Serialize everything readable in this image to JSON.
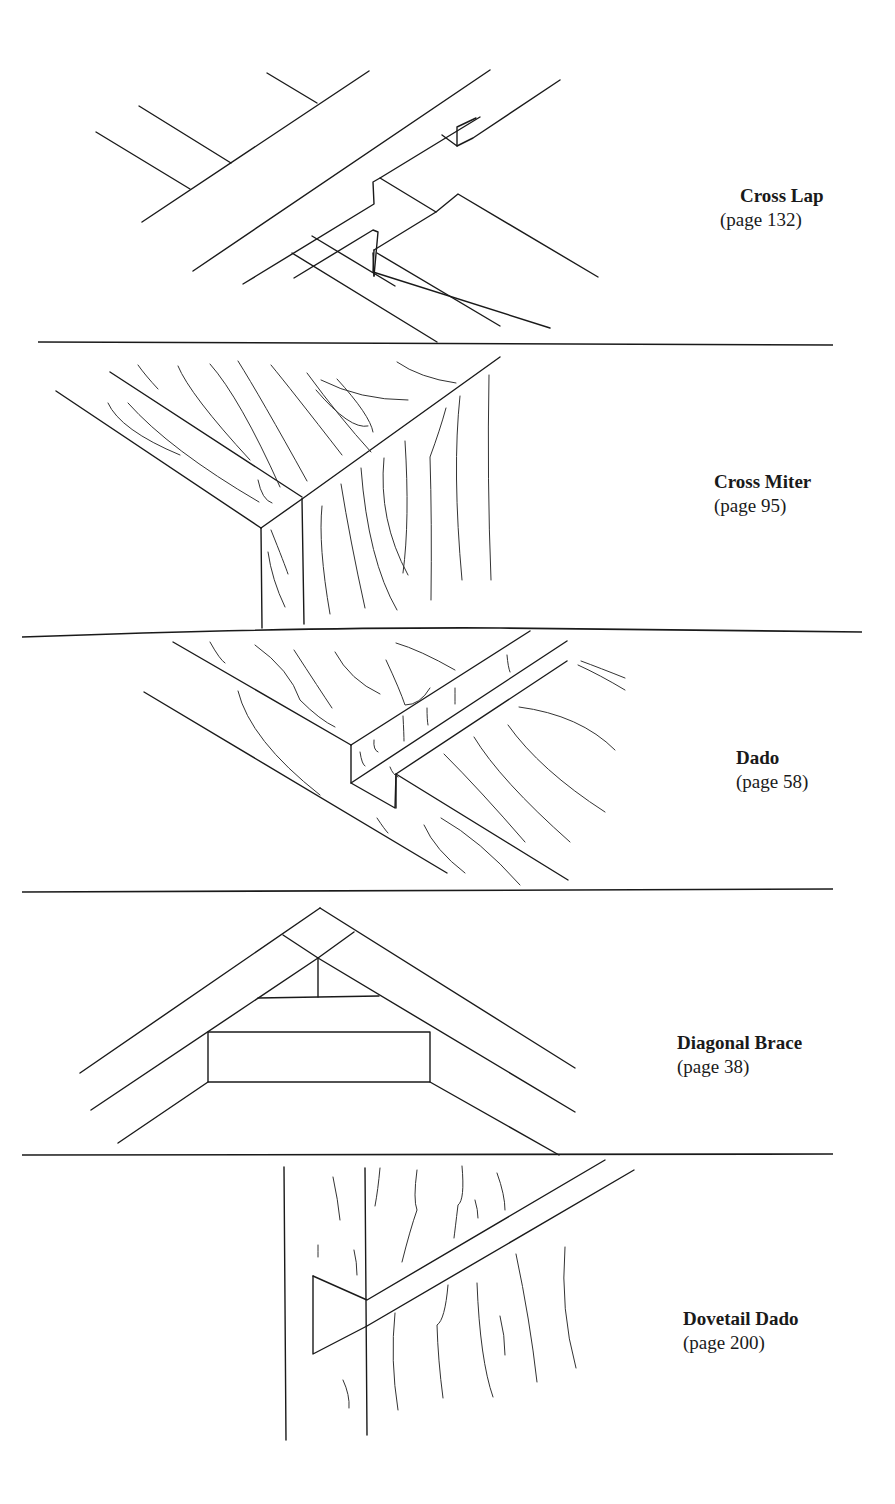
{
  "page": {
    "background": "#ffffff",
    "ink": "#1a1a1a"
  },
  "joints": [
    {
      "title": "Cross Lap",
      "page_ref": "(page 132)",
      "illustration": "cross-lap-drawing"
    },
    {
      "title": "Cross Miter",
      "page_ref": "(page 95)",
      "illustration": "cross-miter-drawing"
    },
    {
      "title": "Dado",
      "page_ref": "(page 58)",
      "illustration": "dado-drawing"
    },
    {
      "title": "Diagonal Brace",
      "page_ref": "(page 38)",
      "illustration": "diagonal-brace-drawing"
    },
    {
      "title": "Dovetail Dado",
      "page_ref": "(page 200)",
      "illustration": "dovetail-dado-drawing"
    }
  ]
}
